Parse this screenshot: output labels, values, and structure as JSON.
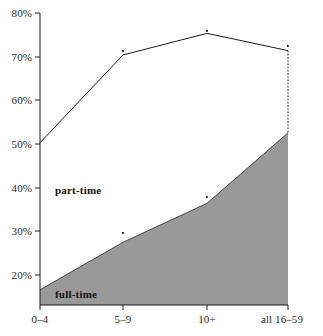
{
  "chart_data": {
    "type": "area",
    "title": "",
    "subtitle": "",
    "xlabel": "",
    "ylabel": "",
    "categories": [
      "0–4",
      "5–9",
      "10+",
      "all 16–59"
    ],
    "series": [
      {
        "name": "full-time",
        "values": [
          16.0,
          27.0,
          36.0,
          52.3
        ]
      },
      {
        "name": "total (full-time + part-time)",
        "values": [
          50.0,
          70.3,
          75.3,
          71.3
        ]
      }
    ],
    "part_time_values": [
      34.0,
      43.3,
      39.3,
      19.0
    ],
    "ylim": [
      12.5,
      81.5
    ],
    "yticks": [
      20,
      30,
      40,
      50,
      60,
      70,
      80
    ],
    "ytick_labels": [
      "20%",
      "30%",
      "40%",
      "50%",
      "60%",
      "70%",
      "80%"
    ],
    "grid": false,
    "legend_position": "inline-annotations",
    "annotations": [
      {
        "text": "part-time",
        "x_fraction": 0.185,
        "y_value": 38.0
      },
      {
        "text": "full-time",
        "x_fraction": 0.185,
        "y_value": 14.5
      }
    ],
    "colors": {
      "full_time_fill": "#999999",
      "line": "#1a1a1a",
      "axis": "#1a1a1a",
      "background": "#ffffff",
      "dotted_connector": "#666666"
    }
  },
  "axes": {
    "y_tick_labels": [
      "80%",
      "70%",
      "60%",
      "50%",
      "40%",
      "30%",
      "20%"
    ],
    "x_tick_labels": [
      "0–4",
      "5–9",
      "10+",
      "all 16–59"
    ]
  },
  "labels": {
    "part_time": "part-time",
    "full_time": "full-time"
  }
}
